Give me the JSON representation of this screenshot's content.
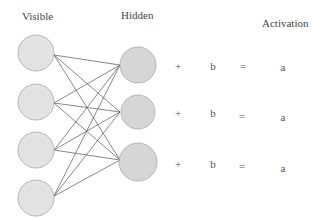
{
  "labels": {
    "visible": "Visible",
    "hidden": "Hidden",
    "activation": "Activation"
  },
  "colors": {
    "visible_fill": "#e3e3e3",
    "hidden_fill": "#d6d6d6",
    "node_stroke": "#a8a8a8",
    "edge": "#555555"
  },
  "rows": [
    {
      "plus": "+",
      "bias": "b",
      "equals": "=",
      "activation": "a"
    },
    {
      "plus": "+",
      "bias": "b",
      "equals": "=",
      "activation": "a"
    },
    {
      "plus": "+",
      "bias": "b",
      "equals": "=",
      "activation": "a"
    }
  ]
}
